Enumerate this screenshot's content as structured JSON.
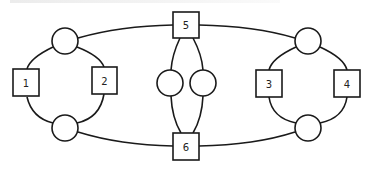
{
  "diagram": {
    "type": "graph",
    "boxes": [
      {
        "id": "1",
        "label": "1"
      },
      {
        "id": "2",
        "label": "2"
      },
      {
        "id": "3",
        "label": "3"
      },
      {
        "id": "4",
        "label": "4"
      },
      {
        "id": "5",
        "label": "5"
      },
      {
        "id": "6",
        "label": "6"
      }
    ],
    "circles": [
      {
        "id": "c_left_top",
        "label": ""
      },
      {
        "id": "c_left_bottom",
        "label": ""
      },
      {
        "id": "c_mid_left",
        "label": ""
      },
      {
        "id": "c_mid_right",
        "label": ""
      },
      {
        "id": "c_right_top",
        "label": ""
      },
      {
        "id": "c_right_bottom",
        "label": ""
      }
    ],
    "edges": [
      [
        "c_left_top",
        "1"
      ],
      [
        "1",
        "c_left_bottom"
      ],
      [
        "c_left_top",
        "2"
      ],
      [
        "2",
        "c_left_bottom"
      ],
      [
        "c_left_top",
        "5"
      ],
      [
        "c_left_bottom",
        "6"
      ],
      [
        "5",
        "c_mid_left"
      ],
      [
        "c_mid_left",
        "6"
      ],
      [
        "5",
        "c_mid_right"
      ],
      [
        "c_mid_right",
        "6"
      ],
      [
        "5",
        "c_right_top"
      ],
      [
        "6",
        "c_right_bottom"
      ],
      [
        "c_right_top",
        "3"
      ],
      [
        "3",
        "c_right_bottom"
      ],
      [
        "c_right_top",
        "4"
      ],
      [
        "4",
        "c_right_bottom"
      ]
    ],
    "colors": {
      "stroke": "#1a1a1a",
      "fill": "#ffffff",
      "text": "#222222"
    }
  }
}
